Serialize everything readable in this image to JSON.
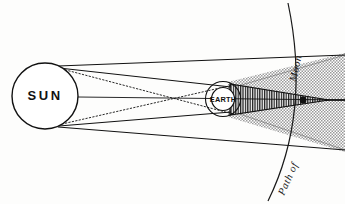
{
  "figure": {
    "kind": "astronomical-diagram",
    "background_color": "#fdfdfc",
    "ink_color": "#111111"
  },
  "labels": {
    "sun": "SUN",
    "earth": "EARTH",
    "path_of": "Path of",
    "moon": "Moon"
  },
  "bodies": {
    "sun": {
      "name": "SUN",
      "center_x": 45,
      "center_y": 96,
      "radius": 33,
      "stroke": "#111111",
      "fill": "#ffffff"
    },
    "earth": {
      "name": "EARTH",
      "center_x": 223,
      "center_y": 99,
      "inner_radius": 11.5,
      "outer_radius": 17.5,
      "stroke": "#111111",
      "fill": "#ffffff"
    },
    "moon": {
      "name": "Moon",
      "center_x": 303,
      "center_y": 100,
      "radius": 3.2,
      "fill": "#111111"
    }
  },
  "shadow": {
    "umbra": {
      "name": "umbra",
      "fill": "#7b7b7b",
      "hatch": "vertical-lines",
      "apex_x": 328,
      "apex_y": 100,
      "base_x": 232,
      "base_half_height": 15
    },
    "penumbra": {
      "name": "penumbra",
      "fill": "#c9c9c9",
      "pattern": "stipple-dots",
      "apex_x": 231,
      "top_right_y": 56,
      "bottom_right_y": 150
    }
  },
  "rays": {
    "outer_tangents": {
      "name": "outer-tangent-rays",
      "style": "solid",
      "description": "Solid lines tangent to Sun and Earth bounding the penumbra"
    },
    "inner_tangents": {
      "name": "inner-tangent-rays",
      "style": "dotted",
      "description": "Dotted crossing lines bounding the umbra cone"
    },
    "axis": {
      "name": "shadow-axis",
      "style": "solid",
      "description": "Sun-Earth-Moon axis extending through the umbra to the right edge"
    }
  },
  "moon_path": {
    "name": "moon-orbital-path",
    "style": "solid-arc",
    "top_x": 288,
    "top_y": 4,
    "bottom_x": 268,
    "bottom_y": 200
  }
}
